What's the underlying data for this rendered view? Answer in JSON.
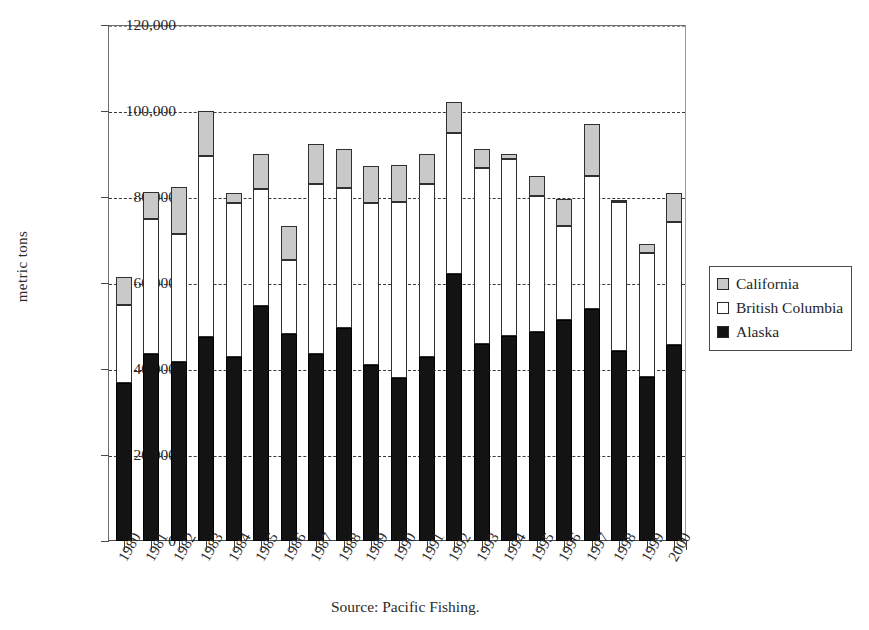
{
  "chart_data": {
    "type": "bar",
    "stacked": true,
    "title": "",
    "xlabel": "",
    "ylabel": "metric tons",
    "ylim": [
      0,
      120000
    ],
    "ytick_values": [
      0,
      20000,
      40000,
      60000,
      80000,
      100000,
      120000
    ],
    "ytick_labels": [
      "0",
      "20,000",
      "40,000",
      "60,000",
      "80,000",
      "100,000",
      "120,000"
    ],
    "grid": "horizontal-dashed",
    "legend_position": "right",
    "categories": [
      "1980",
      "1981",
      "1982",
      "1983",
      "1984",
      "1985",
      "1986",
      "1987",
      "1988",
      "1989",
      "1990",
      "1991",
      "1992",
      "1993",
      "1994",
      "1995",
      "1996",
      "1997",
      "1998",
      "1999",
      "2000"
    ],
    "series": [
      {
        "name": "Alaska",
        "color": "#131313",
        "values": [
          36700,
          43400,
          41700,
          47500,
          42700,
          54700,
          48200,
          43600,
          49500,
          41000,
          37900,
          42800,
          62000,
          45900,
          47700,
          48700,
          51300,
          54000,
          44100,
          38100,
          45700
        ]
      },
      {
        "name": "British Columbia",
        "color": "#ffffff",
        "values": [
          18300,
          31600,
          29700,
          42000,
          35800,
          27200,
          17100,
          39500,
          32700,
          37500,
          40900,
          40200,
          33000,
          40800,
          41200,
          31500,
          21900,
          30800,
          34700,
          28900,
          28600
        ]
      },
      {
        "name": "California",
        "color": "#c9c9c9",
        "values": [
          6500,
          6200,
          11000,
          10500,
          2500,
          8100,
          7900,
          9200,
          9000,
          8600,
          8700,
          7000,
          7000,
          4500,
          1100,
          4800,
          6400,
          12200,
          400,
          2000,
          6700
        ]
      }
    ],
    "totals": [
      61500,
      81200,
      82400,
      100000,
      81000,
      90000,
      73200,
      92300,
      91200,
      87100,
      87500,
      90000,
      102000,
      91200,
      90000,
      85000,
      79600,
      97000,
      79200,
      69000,
      81000
    ]
  },
  "legend": {
    "items": [
      {
        "label": "California",
        "swatch": "ca"
      },
      {
        "label": "British Columbia",
        "swatch": "bc"
      },
      {
        "label": "Alaska",
        "swatch": "ak"
      }
    ]
  },
  "source_note": "Source:  Pacific Fishing."
}
